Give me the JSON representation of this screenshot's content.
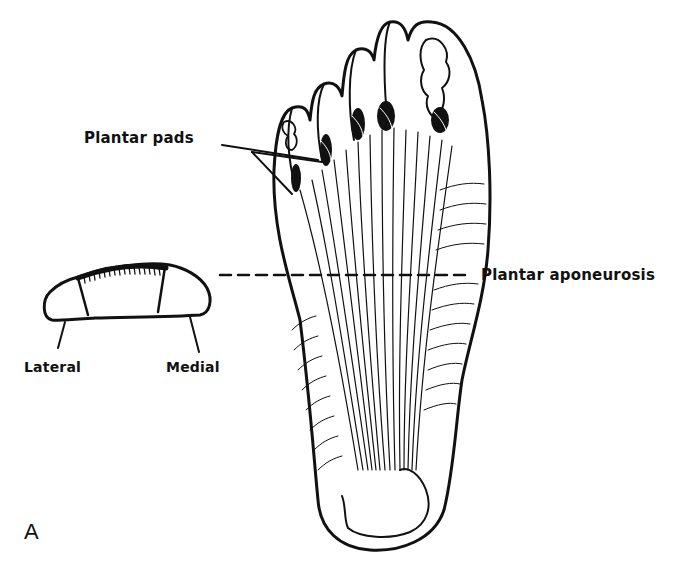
{
  "figure": {
    "panel_letter": "A",
    "background_color": "#ffffff",
    "ink_color": "#111111"
  },
  "labels": {
    "plantar_pads": "Plantar pads",
    "plantar_aponeurosis": "Plantar aponeurosis",
    "lateral": "Lateral",
    "medial": "Medial"
  },
  "drawings": {
    "cross_section": "cross-section of foot sole showing plantar aponeurosis band with lateral and medial compartments",
    "foot_plantar_view": "plantar view of foot showing plantar aponeurosis fanning to five toes with plantar pads"
  }
}
